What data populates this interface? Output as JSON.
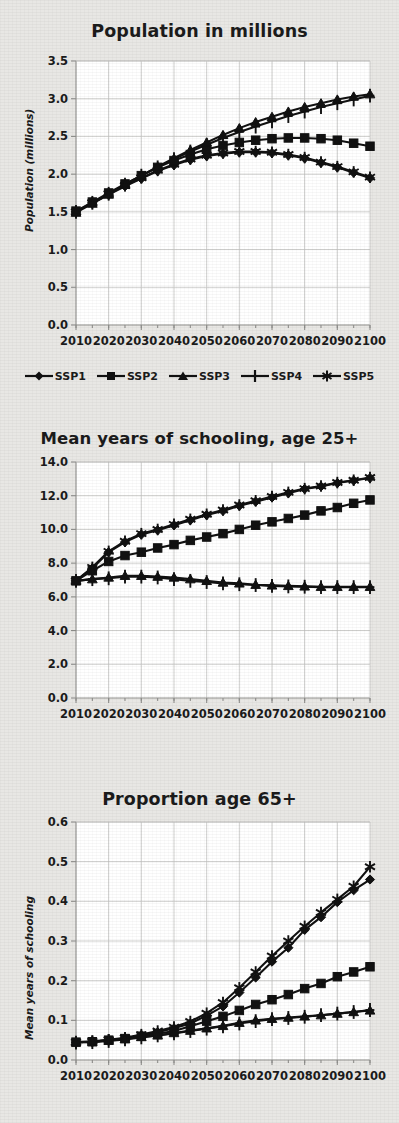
{
  "figure": {
    "background_color": "#e8e7e4",
    "plot_background_color": "#ffffff",
    "line_color": "#111111",
    "grid_color": "#c3c3c0"
  },
  "legend": {
    "position": "below-first-chart",
    "items": [
      {
        "label": "SSP1",
        "marker": "diamond",
        "icon_name": "legend-marker-diamond"
      },
      {
        "label": "SSP2",
        "marker": "square",
        "icon_name": "legend-marker-square"
      },
      {
        "label": "SSP3",
        "marker": "triangle",
        "icon_name": "legend-marker-triangle"
      },
      {
        "label": "SSP4",
        "marker": "plus",
        "icon_name": "legend-marker-plus"
      },
      {
        "label": "SSP5",
        "marker": "asterisk",
        "icon_name": "legend-marker-asterisk"
      }
    ]
  },
  "charts": [
    {
      "id": "population",
      "title": "Population in millions",
      "ylabel": "Population (millions)",
      "xlabel": "",
      "xticklabels": [
        "2010",
        "2020",
        "2030",
        "2040",
        "2050",
        "2060",
        "2070",
        "2080",
        "2090",
        "2100"
      ],
      "yticklabels": [
        "0.0",
        "0.5",
        "1.0",
        "1.5",
        "2.0",
        "2.5",
        "3.0",
        "3.5"
      ]
    },
    {
      "id": "schooling",
      "title": "Mean years of schooling, age 25+",
      "ylabel": "Mean years of schooling",
      "xlabel": "",
      "xticklabels": [
        "2010",
        "2020",
        "2030",
        "2040",
        "2050",
        "2060",
        "2070",
        "2080",
        "2090",
        "2100"
      ],
      "yticklabels": [
        "0.0",
        "2.0",
        "4.0",
        "6.0",
        "8.0",
        "10.0",
        "12.0",
        "14.0"
      ]
    },
    {
      "id": "proportion65",
      "title": "Proportion age 65+",
      "ylabel": "Proportion",
      "xlabel": "",
      "xticklabels": [
        "2010",
        "2020",
        "2030",
        "2040",
        "2050",
        "2060",
        "2070",
        "2080",
        "2090",
        "2100"
      ],
      "yticklabels": [
        "0.0",
        "0.1",
        "0.2",
        "0.3",
        "0.4",
        "0.5",
        "0.6"
      ]
    }
  ],
  "chart_data": [
    {
      "type": "line",
      "title": "Population in millions",
      "xlabel": "",
      "ylabel": "Population (millions)",
      "ylim": [
        0.0,
        3.5
      ],
      "ytick_step": 0.5,
      "xlim": [
        2010,
        2100
      ],
      "grid": true,
      "legend_position": "bottom",
      "x": [
        2010,
        2015,
        2020,
        2025,
        2030,
        2035,
        2040,
        2045,
        2050,
        2055,
        2060,
        2065,
        2070,
        2075,
        2080,
        2085,
        2090,
        2095,
        2100
      ],
      "series": [
        {
          "name": "SSP1",
          "marker": "diamond",
          "values": [
            1.5,
            1.62,
            1.73,
            1.84,
            1.94,
            2.04,
            2.12,
            2.19,
            2.24,
            2.27,
            2.29,
            2.29,
            2.28,
            2.25,
            2.21,
            2.15,
            2.09,
            2.02,
            1.95
          ]
        },
        {
          "name": "SSP2",
          "marker": "square",
          "values": [
            1.51,
            1.63,
            1.75,
            1.87,
            1.98,
            2.09,
            2.18,
            2.26,
            2.33,
            2.38,
            2.42,
            2.45,
            2.47,
            2.48,
            2.48,
            2.47,
            2.45,
            2.41,
            2.37
          ]
        },
        {
          "name": "SSP3",
          "marker": "triangle",
          "values": [
            1.49,
            1.61,
            1.73,
            1.86,
            1.98,
            2.1,
            2.21,
            2.32,
            2.42,
            2.52,
            2.61,
            2.69,
            2.76,
            2.83,
            2.89,
            2.94,
            2.99,
            3.03,
            3.06
          ]
        },
        {
          "name": "SSP4",
          "marker": "plus",
          "values": [
            1.5,
            1.62,
            1.74,
            1.86,
            1.98,
            2.09,
            2.2,
            2.3,
            2.39,
            2.48,
            2.56,
            2.63,
            2.7,
            2.77,
            2.83,
            2.89,
            2.94,
            2.99,
            3.04
          ]
        },
        {
          "name": "SSP5",
          "marker": "asterisk",
          "values": [
            1.5,
            1.62,
            1.74,
            1.85,
            1.95,
            2.05,
            2.13,
            2.2,
            2.25,
            2.28,
            2.3,
            2.3,
            2.29,
            2.26,
            2.22,
            2.16,
            2.1,
            2.03,
            1.96
          ]
        }
      ]
    },
    {
      "type": "line",
      "title": "Mean years of schooling, age 25+",
      "xlabel": "",
      "ylabel": "Mean years of schooling",
      "ylim": [
        0.0,
        14.0
      ],
      "ytick_step": 2.0,
      "xlim": [
        2010,
        2100
      ],
      "grid": true,
      "legend_position": "bottom",
      "x": [
        2010,
        2015,
        2020,
        2025,
        2030,
        2035,
        2040,
        2045,
        2050,
        2055,
        2060,
        2065,
        2070,
        2075,
        2080,
        2085,
        2090,
        2095,
        2100
      ],
      "series": [
        {
          "name": "SSP1",
          "marker": "diamond",
          "values": [
            6.95,
            7.7,
            8.65,
            9.25,
            9.7,
            9.95,
            10.25,
            10.55,
            10.85,
            11.1,
            11.4,
            11.65,
            11.9,
            12.15,
            12.4,
            12.55,
            12.75,
            12.9,
            13.05
          ]
        },
        {
          "name": "SSP2",
          "marker": "square",
          "values": [
            6.95,
            7.55,
            8.1,
            8.45,
            8.65,
            8.9,
            9.1,
            9.35,
            9.55,
            9.75,
            10.0,
            10.25,
            10.45,
            10.65,
            10.85,
            11.1,
            11.3,
            11.55,
            11.75
          ]
        },
        {
          "name": "SSP3",
          "marker": "triangle",
          "values": [
            6.95,
            7.05,
            7.15,
            7.25,
            7.25,
            7.2,
            7.15,
            7.05,
            6.95,
            6.85,
            6.8,
            6.72,
            6.68,
            6.65,
            6.62,
            6.6,
            6.6,
            6.6,
            6.6
          ]
        },
        {
          "name": "SSP4",
          "marker": "plus",
          "values": [
            6.95,
            7.05,
            7.1,
            7.2,
            7.2,
            7.15,
            7.05,
            6.95,
            6.88,
            6.8,
            6.75,
            6.7,
            6.65,
            6.62,
            6.6,
            6.58,
            6.58,
            6.58,
            6.58
          ]
        },
        {
          "name": "SSP5",
          "marker": "asterisk",
          "values": [
            6.95,
            7.75,
            8.7,
            9.3,
            9.75,
            10.0,
            10.3,
            10.6,
            10.9,
            11.15,
            11.45,
            11.7,
            11.95,
            12.2,
            12.42,
            12.58,
            12.78,
            12.92,
            13.08
          ]
        }
      ]
    },
    {
      "type": "line",
      "title": "Proportion age 65+",
      "xlabel": "",
      "ylabel": "Proportion",
      "ylim": [
        0.0,
        0.6
      ],
      "ytick_step": 0.1,
      "xlim": [
        2010,
        2100
      ],
      "grid": true,
      "legend_position": "bottom",
      "x": [
        2010,
        2015,
        2020,
        2025,
        2030,
        2035,
        2040,
        2045,
        2050,
        2055,
        2060,
        2065,
        2070,
        2075,
        2080,
        2085,
        2090,
        2095,
        2100
      ],
      "series": [
        {
          "name": "SSP1",
          "marker": "diamond",
          "values": [
            0.045,
            0.046,
            0.05,
            0.055,
            0.062,
            0.07,
            0.08,
            0.092,
            0.112,
            0.135,
            0.17,
            0.208,
            0.248,
            0.283,
            0.328,
            0.36,
            0.398,
            0.428,
            0.455
          ]
        },
        {
          "name": "SSP2",
          "marker": "square",
          "values": [
            0.045,
            0.046,
            0.05,
            0.054,
            0.06,
            0.066,
            0.073,
            0.085,
            0.098,
            0.11,
            0.125,
            0.14,
            0.152,
            0.165,
            0.18,
            0.193,
            0.21,
            0.222,
            0.235
          ]
        },
        {
          "name": "SSP3",
          "marker": "triangle",
          "values": [
            0.045,
            0.046,
            0.049,
            0.053,
            0.058,
            0.062,
            0.068,
            0.074,
            0.08,
            0.086,
            0.094,
            0.1,
            0.104,
            0.107,
            0.11,
            0.113,
            0.117,
            0.121,
            0.125
          ]
        },
        {
          "name": "SSP4",
          "marker": "plus",
          "values": [
            0.044,
            0.045,
            0.048,
            0.052,
            0.057,
            0.062,
            0.067,
            0.073,
            0.079,
            0.085,
            0.092,
            0.098,
            0.103,
            0.106,
            0.109,
            0.113,
            0.117,
            0.121,
            0.126
          ]
        },
        {
          "name": "SSP5",
          "marker": "asterisk",
          "values": [
            0.045,
            0.047,
            0.051,
            0.056,
            0.064,
            0.073,
            0.083,
            0.097,
            0.118,
            0.145,
            0.182,
            0.222,
            0.262,
            0.3,
            0.337,
            0.372,
            0.405,
            0.438,
            0.487
          ]
        }
      ]
    }
  ]
}
